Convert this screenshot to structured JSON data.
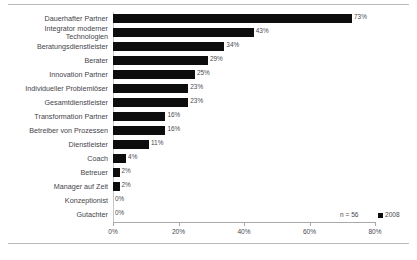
{
  "chart_data": {
    "type": "bar",
    "orientation": "horizontal",
    "title": "",
    "subtitle": "",
    "xlabel": "",
    "ylabel": "",
    "xlim": [
      0,
      80
    ],
    "xticks": [
      0,
      20,
      40,
      60,
      80
    ],
    "xtick_labels": [
      "0%",
      "20%",
      "40%",
      "60%",
      "80%"
    ],
    "grid": false,
    "legend_position": "bottom-right",
    "legend": [
      {
        "label": "2008",
        "color": "#0d0d0d"
      }
    ],
    "annotations": [
      {
        "text": "n = 56"
      }
    ],
    "series_color": "#0d0d0d",
    "categories": [
      "Dauerhafter Partner",
      "Integrator moderner\nTechnologien",
      "Beratungsdienstleister",
      "Berater",
      "Innovation Partner",
      "Individueller Problemlöser",
      "Gesamtdienstleister",
      "Transformation Partner",
      "Betreiber von Prozessen",
      "Dienstleister",
      "Coach",
      "Betreuer",
      "Manager auf Zeit",
      "Konzeptionist",
      "Gutachter"
    ],
    "values": [
      73,
      43,
      34,
      29,
      25,
      23,
      23,
      16,
      16,
      11,
      4,
      2,
      2,
      0,
      0
    ],
    "value_labels": [
      "73%",
      "43%",
      "34%",
      "29%",
      "25%",
      "23%",
      "23%",
      "16%",
      "16%",
      "11%",
      "4%",
      "2%",
      "2%",
      "0%",
      "0%"
    ]
  }
}
